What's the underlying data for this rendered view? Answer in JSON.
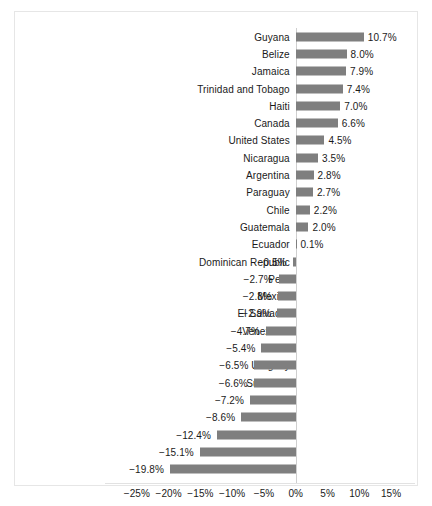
{
  "chart_data": {
    "type": "bar",
    "orientation": "horizontal",
    "title": "",
    "subtitle": "",
    "xlabel": "",
    "ylabel": "",
    "xlim": [
      -27.5,
      17.5
    ],
    "xticks": [
      -25,
      -20,
      -15,
      -10,
      -5,
      0,
      5,
      10,
      15
    ],
    "xtick_labels": [
      "−25%",
      "−20%",
      "−15%",
      "−10%",
      "−5%",
      "0%",
      "5%",
      "10%",
      "15%"
    ],
    "grid": false,
    "legend": null,
    "bar_color": "#7f7f7f",
    "categories": [
      "Guyana",
      "Belize",
      "Jamaica",
      "Trinidad and Tobago",
      "Haiti",
      "Canada",
      "United States",
      "Nicaragua",
      "Argentina",
      "Paraguay",
      "Chile",
      "Guatemala",
      "Ecuador",
      "Dominican Republic",
      "Peru",
      "Mexico",
      "El Salvador",
      "Venezuela",
      "Brazil",
      "Uruguay",
      "Suriname",
      "Bolivia",
      "Colombia",
      "Panama",
      "Costa Rica",
      "Honduras"
    ],
    "values": [
      10.7,
      8.0,
      7.9,
      7.4,
      7.0,
      6.6,
      4.5,
      3.5,
      2.8,
      2.7,
      2.2,
      2.0,
      0.1,
      -0.5,
      -2.7,
      -2.8,
      -2.9,
      -4.7,
      -5.4,
      -6.5,
      -6.6,
      -7.2,
      -8.6,
      -12.4,
      -15.1,
      -19.8
    ],
    "value_labels": [
      "10.7%",
      "8.0%",
      "7.9%",
      "7.4%",
      "7.0%",
      "6.6%",
      "4.5%",
      "3.5%",
      "2.8%",
      "2.7%",
      "2.2%",
      "2.0%",
      "0.1%",
      "−0.5%",
      "−2.7%",
      "−2.8%",
      "−2.9%",
      "−4.7%",
      "−5.4%",
      "−6.5%",
      "−6.6%",
      "−7.2%",
      "−8.6%",
      "−12.4%",
      "−15.1%",
      "−19.8%"
    ]
  },
  "caption": {
    "text": ""
  }
}
